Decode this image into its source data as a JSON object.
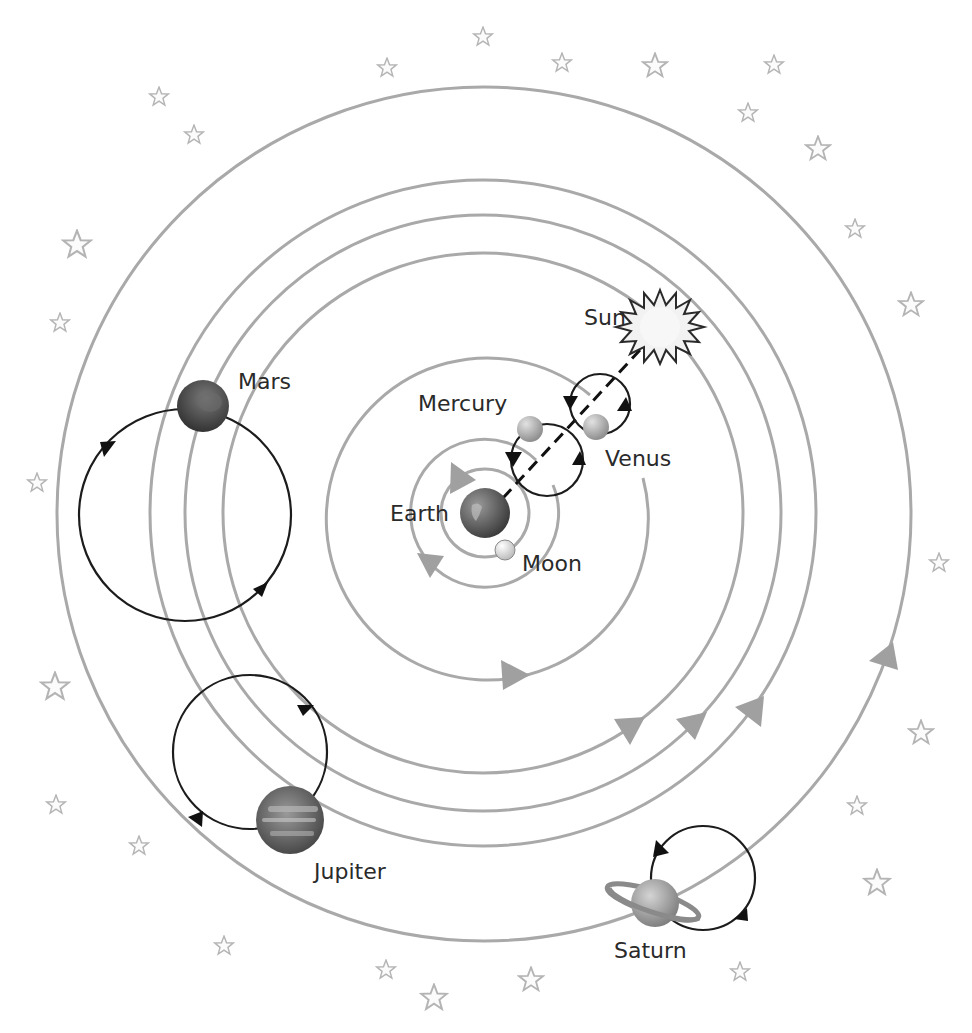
{
  "diagram": {
    "colors": {
      "orbit": "#a9a9a9",
      "epicycle": "#1c1c1c",
      "star_outline": "#b4b4b4",
      "label": "#2a2a2a"
    },
    "labels": {
      "sun": "Sun",
      "mercury": "Mercury",
      "venus": "Venus",
      "earth": "Earth",
      "moon": "Moon",
      "mars": "Mars",
      "jupiter": "Jupiter",
      "saturn": "Saturn"
    },
    "center": "Earth",
    "bodies": [
      "Earth",
      "Moon",
      "Mercury",
      "Venus",
      "Sun",
      "Mars",
      "Jupiter",
      "Saturn"
    ]
  }
}
